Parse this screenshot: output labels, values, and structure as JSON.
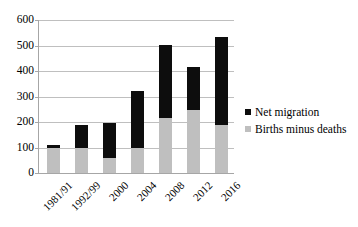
{
  "chart_data": {
    "type": "bar",
    "stacked": true,
    "title": "",
    "xlabel": "",
    "ylabel": "",
    "ylim": [
      0,
      600
    ],
    "ytick_step": 100,
    "yticks": [
      "0",
      "100",
      "200",
      "300",
      "400",
      "500",
      "600"
    ],
    "grid": true,
    "legend_position": "right",
    "categories": [
      "1981/91",
      "1992/99",
      "2000",
      "2004",
      "2008",
      "2012",
      "2016"
    ],
    "series": [
      {
        "name": "Births minus deaths",
        "color": "#bfbfbf",
        "values": [
          100,
          98,
          60,
          100,
          215,
          248,
          190
        ]
      },
      {
        "name": "Net migration",
        "color": "#0d0d0d",
        "values": [
          8,
          90,
          138,
          220,
          286,
          168,
          343
        ]
      }
    ],
    "totals": [
      108,
      188,
      198,
      320,
      501,
      416,
      533
    ]
  },
  "legend": {
    "items": [
      {
        "label": "Net migration",
        "swatch": "#0d0d0d"
      },
      {
        "label": "Births minus deaths",
        "swatch": "#bfbfbf"
      }
    ]
  }
}
